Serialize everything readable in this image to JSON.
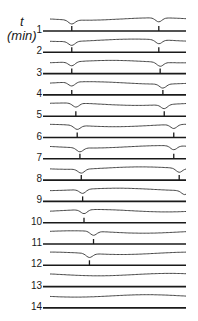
{
  "figure": {
    "axis_label_symbol": "t",
    "axis_label_unit": "(min)",
    "rows": [
      {
        "label": "1",
        "marks": [
          0.16,
          0.8
        ]
      },
      {
        "label": "2",
        "marks": [
          0.16,
          0.8
        ]
      },
      {
        "label": "3",
        "marks": [
          0.16,
          0.81
        ]
      },
      {
        "label": "4",
        "marks": [
          0.16,
          0.83
        ]
      },
      {
        "label": "5",
        "marks": [
          0.19,
          0.84
        ]
      },
      {
        "label": "6",
        "marks": [
          0.2,
          0.91
        ]
      },
      {
        "label": "7",
        "marks": [
          0.22,
          0.91
        ]
      },
      {
        "label": "8",
        "marks": [
          0.23,
          0.95
        ]
      },
      {
        "label": "9",
        "marks": [
          0.24,
          0.99
        ]
      },
      {
        "label": "10",
        "marks": [
          0.25
        ]
      },
      {
        "label": "11",
        "marks": [
          0.32
        ]
      },
      {
        "label": "12",
        "marks": [
          0.29
        ]
      },
      {
        "label": "13",
        "marks": []
      },
      {
        "label": "14",
        "marks": []
      }
    ]
  }
}
